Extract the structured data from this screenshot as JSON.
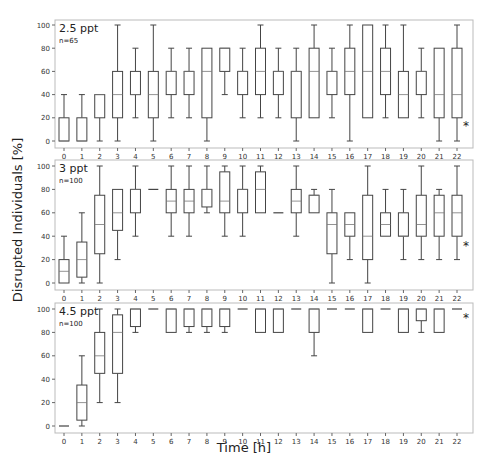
{
  "figure": {
    "ylabel": "Disrupted Individuals [%]",
    "xlabel": "Time [h]"
  },
  "chart_data": [
    {
      "type": "box",
      "title": "2.5 ppt",
      "subtitle": "n=65",
      "annotation": "*",
      "xlabel": "Time [h]",
      "ylabel": "Disrupted Individuals [%]",
      "categories": [
        "0",
        "1",
        "2",
        "3",
        "4",
        "5",
        "6",
        "7",
        "8",
        "9",
        "10",
        "11",
        "12",
        "13",
        "14",
        "15",
        "16",
        "17",
        "18",
        "19",
        "20",
        "21",
        "22"
      ],
      "yticks": [
        0,
        20,
        40,
        60,
        80,
        100
      ],
      "ylim": [
        0,
        100
      ],
      "boxes": [
        {
          "x": 0,
          "min": 0,
          "q1": 0,
          "median": 0,
          "q3": 20,
          "max": 40
        },
        {
          "x": 1,
          "min": 0,
          "q1": 0,
          "median": 0,
          "q3": 20,
          "max": 40
        },
        {
          "x": 2,
          "min": 0,
          "q1": 20,
          "median": 40,
          "q3": 40,
          "max": 40
        },
        {
          "x": 3,
          "min": 0,
          "q1": 20,
          "median": 40,
          "q3": 60,
          "max": 100
        },
        {
          "x": 4,
          "min": 20,
          "q1": 40,
          "median": 40,
          "q3": 60,
          "max": 80
        },
        {
          "x": 5,
          "min": 0,
          "q1": 20,
          "median": 40,
          "q3": 60,
          "max": 100
        },
        {
          "x": 6,
          "min": 20,
          "q1": 40,
          "median": 60,
          "q3": 60,
          "max": 80
        },
        {
          "x": 7,
          "min": 20,
          "q1": 40,
          "median": 60,
          "q3": 60,
          "max": 80
        },
        {
          "x": 8,
          "min": 0,
          "q1": 20,
          "median": 60,
          "q3": 80,
          "max": 80
        },
        {
          "x": 9,
          "min": 40,
          "q1": 60,
          "median": 80,
          "q3": 80,
          "max": 80
        },
        {
          "x": 10,
          "min": 20,
          "q1": 40,
          "median": 60,
          "q3": 60,
          "max": 80
        },
        {
          "x": 11,
          "min": 20,
          "q1": 40,
          "median": 60,
          "q3": 80,
          "max": 100
        },
        {
          "x": 12,
          "min": 20,
          "q1": 40,
          "median": 60,
          "q3": 60,
          "max": 80
        },
        {
          "x": 13,
          "min": 0,
          "q1": 20,
          "median": 60,
          "q3": 60,
          "max": 80
        },
        {
          "x": 14,
          "min": 20,
          "q1": 20,
          "median": 60,
          "q3": 80,
          "max": 100
        },
        {
          "x": 15,
          "min": 20,
          "q1": 40,
          "median": 60,
          "q3": 60,
          "max": 80
        },
        {
          "x": 16,
          "min": 0,
          "q1": 40,
          "median": 60,
          "q3": 80,
          "max": 100
        },
        {
          "x": 17,
          "min": 20,
          "q1": 20,
          "median": 60,
          "q3": 100,
          "max": 100
        },
        {
          "x": 18,
          "min": 20,
          "q1": 40,
          "median": 60,
          "q3": 80,
          "max": 100
        },
        {
          "x": 19,
          "min": 20,
          "q1": 20,
          "median": 40,
          "q3": 60,
          "max": 100
        },
        {
          "x": 20,
          "min": 20,
          "q1": 40,
          "median": 60,
          "q3": 60,
          "max": 80
        },
        {
          "x": 21,
          "min": 0,
          "q1": 20,
          "median": 40,
          "q3": 80,
          "max": 80
        },
        {
          "x": 22,
          "min": 0,
          "q1": 20,
          "median": 40,
          "q3": 80,
          "max": 100
        }
      ]
    },
    {
      "type": "box",
      "title": "3 ppt",
      "subtitle": "n=100",
      "annotation": "*",
      "xlabel": "Time [h]",
      "ylabel": "Disrupted Individuals [%]",
      "categories": [
        "0",
        "1",
        "2",
        "3",
        "4",
        "5",
        "6",
        "7",
        "8",
        "9",
        "10",
        "11",
        "12",
        "13",
        "14",
        "15",
        "16",
        "17",
        "18",
        "19",
        "20",
        "21",
        "22"
      ],
      "yticks": [
        0,
        20,
        40,
        60,
        80,
        100
      ],
      "ylim": [
        0,
        100
      ],
      "boxes": [
        {
          "x": 0,
          "min": 0,
          "q1": 0,
          "median": 10,
          "q3": 20,
          "max": 40
        },
        {
          "x": 1,
          "min": 0,
          "q1": 5,
          "median": 20,
          "q3": 35,
          "max": 60
        },
        {
          "x": 2,
          "min": 0,
          "q1": 25,
          "median": 50,
          "q3": 75,
          "max": 100
        },
        {
          "x": 3,
          "min": 20,
          "q1": 45,
          "median": 60,
          "q3": 80,
          "max": 80
        },
        {
          "x": 4,
          "min": 40,
          "q1": 60,
          "median": 80,
          "q3": 80,
          "max": 100
        },
        {
          "x": 5,
          "min": 80,
          "q1": 80,
          "median": 80,
          "q3": 80,
          "max": 80
        },
        {
          "x": 6,
          "min": 40,
          "q1": 60,
          "median": 70,
          "q3": 80,
          "max": 100
        },
        {
          "x": 7,
          "min": 40,
          "q1": 60,
          "median": 70,
          "q3": 80,
          "max": 100
        },
        {
          "x": 8,
          "min": 60,
          "q1": 65,
          "median": 80,
          "q3": 80,
          "max": 100
        },
        {
          "x": 9,
          "min": 40,
          "q1": 60,
          "median": 70,
          "q3": 95,
          "max": 100
        },
        {
          "x": 10,
          "min": 40,
          "q1": 60,
          "median": 80,
          "q3": 80,
          "max": 100
        },
        {
          "x": 11,
          "min": 60,
          "q1": 60,
          "median": 80,
          "q3": 95,
          "max": 100
        },
        {
          "x": 12,
          "min": 60,
          "q1": 60,
          "median": 60,
          "q3": 60,
          "max": 60
        },
        {
          "x": 13,
          "min": 40,
          "q1": 60,
          "median": 70,
          "q3": 80,
          "max": 100
        },
        {
          "x": 14,
          "min": 60,
          "q1": 60,
          "median": 75,
          "q3": 75,
          "max": 80
        },
        {
          "x": 15,
          "min": 0,
          "q1": 25,
          "median": 50,
          "q3": 60,
          "max": 80
        },
        {
          "x": 16,
          "min": 20,
          "q1": 40,
          "median": 50,
          "q3": 60,
          "max": 60
        },
        {
          "x": 17,
          "min": 0,
          "q1": 20,
          "median": 40,
          "q3": 75,
          "max": 100
        },
        {
          "x": 18,
          "min": 40,
          "q1": 40,
          "median": 50,
          "q3": 60,
          "max": 80
        },
        {
          "x": 19,
          "min": 20,
          "q1": 40,
          "median": 40,
          "q3": 60,
          "max": 80
        },
        {
          "x": 20,
          "min": 20,
          "q1": 40,
          "median": 50,
          "q3": 75,
          "max": 100
        },
        {
          "x": 21,
          "min": 20,
          "q1": 40,
          "median": 60,
          "q3": 75,
          "max": 80
        },
        {
          "x": 22,
          "min": 20,
          "q1": 40,
          "median": 60,
          "q3": 75,
          "max": 100
        }
      ]
    },
    {
      "type": "box",
      "title": "4.5 ppt",
      "subtitle": "n=100",
      "annotation": "*",
      "xlabel": "Time [h]",
      "ylabel": "Disrupted Individuals [%]",
      "categories": [
        "0",
        "1",
        "2",
        "3",
        "4",
        "5",
        "6",
        "7",
        "8",
        "9",
        "10",
        "11",
        "12",
        "13",
        "14",
        "15",
        "16",
        "17",
        "18",
        "19",
        "20",
        "21",
        "22"
      ],
      "yticks": [
        0,
        20,
        40,
        60,
        80,
        100
      ],
      "ylim": [
        0,
        100
      ],
      "boxes": [
        {
          "x": 0,
          "min": 0,
          "q1": 0,
          "median": 0,
          "q3": 0,
          "max": 0
        },
        {
          "x": 1,
          "min": 0,
          "q1": 5,
          "median": 20,
          "q3": 35,
          "max": 60
        },
        {
          "x": 2,
          "min": 20,
          "q1": 45,
          "median": 60,
          "q3": 80,
          "max": 100
        },
        {
          "x": 3,
          "min": 20,
          "q1": 45,
          "median": 80,
          "q3": 95,
          "max": 100
        },
        {
          "x": 4,
          "min": 80,
          "q1": 85,
          "median": 100,
          "q3": 100,
          "max": 100
        },
        {
          "x": 5,
          "min": 100,
          "q1": 100,
          "median": 100,
          "q3": 100,
          "max": 100
        },
        {
          "x": 6,
          "min": 80,
          "q1": 80,
          "median": 100,
          "q3": 100,
          "max": 100
        },
        {
          "x": 7,
          "min": 80,
          "q1": 85,
          "median": 100,
          "q3": 100,
          "max": 100
        },
        {
          "x": 8,
          "min": 80,
          "q1": 85,
          "median": 100,
          "q3": 100,
          "max": 100
        },
        {
          "x": 9,
          "min": 80,
          "q1": 85,
          "median": 100,
          "q3": 100,
          "max": 100
        },
        {
          "x": 10,
          "min": 100,
          "q1": 100,
          "median": 100,
          "q3": 100,
          "max": 100
        },
        {
          "x": 11,
          "min": 80,
          "q1": 80,
          "median": 100,
          "q3": 100,
          "max": 100
        },
        {
          "x": 12,
          "min": 80,
          "q1": 80,
          "median": 100,
          "q3": 100,
          "max": 100
        },
        {
          "x": 13,
          "min": 100,
          "q1": 100,
          "median": 100,
          "q3": 100,
          "max": 100
        },
        {
          "x": 14,
          "min": 60,
          "q1": 80,
          "median": 100,
          "q3": 100,
          "max": 100
        },
        {
          "x": 15,
          "min": 100,
          "q1": 100,
          "median": 100,
          "q3": 100,
          "max": 100
        },
        {
          "x": 16,
          "min": 100,
          "q1": 100,
          "median": 100,
          "q3": 100,
          "max": 100
        },
        {
          "x": 17,
          "min": 80,
          "q1": 80,
          "median": 100,
          "q3": 100,
          "max": 100
        },
        {
          "x": 18,
          "min": 100,
          "q1": 100,
          "median": 100,
          "q3": 100,
          "max": 100
        },
        {
          "x": 19,
          "min": 80,
          "q1": 80,
          "median": 100,
          "q3": 100,
          "max": 100
        },
        {
          "x": 20,
          "min": 80,
          "q1": 90,
          "median": 100,
          "q3": 100,
          "max": 100
        },
        {
          "x": 21,
          "min": 80,
          "q1": 80,
          "median": 100,
          "q3": 100,
          "max": 100
        },
        {
          "x": 22,
          "min": 100,
          "q1": 100,
          "median": 100,
          "q3": 100,
          "max": 100
        }
      ]
    }
  ]
}
